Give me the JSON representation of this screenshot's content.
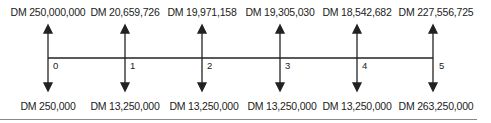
{
  "diagram": {
    "type": "cash-flow-timeline",
    "currency": "DM",
    "periods": [
      {
        "period": "0",
        "inflow": "DM 250,000,000",
        "outflow": "DM 250,000"
      },
      {
        "period": "1",
        "inflow": "DM 20,659,726",
        "outflow": "DM 13,250,000"
      },
      {
        "period": "2",
        "inflow": "DM 19,971,158",
        "outflow": "DM 13,250,000"
      },
      {
        "period": "3",
        "inflow": "DM 19,305,030",
        "outflow": "DM 13,250,000"
      },
      {
        "period": "4",
        "inflow": "DM 18,542,682",
        "outflow": "DM 13,250,000"
      },
      {
        "period": "5",
        "inflow": "DM 227,556,725",
        "outflow": "DM 263,250,000"
      }
    ],
    "line_color": "#222222"
  }
}
